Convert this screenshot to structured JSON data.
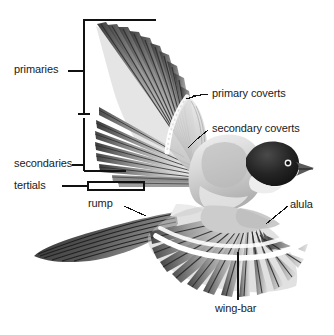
{
  "figure": {
    "type": "bird-anatomy-diagram",
    "style": "grayscale halftone illustration",
    "background_color": "#ffffff",
    "label_color": "#1a1a1a",
    "leader_color": "#111111"
  },
  "labels": {
    "primaries": "primaries",
    "secondaries": "secondaries",
    "tertials": "tertials",
    "rump": "rump",
    "primary_coverts": "primary coverts",
    "secondary_coverts": "secondary coverts",
    "alula": "alula",
    "wing_bar": "wing-bar"
  }
}
